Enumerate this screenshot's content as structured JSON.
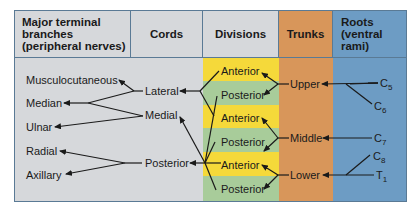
{
  "colors": {
    "gray": "#d6d8db",
    "yellow": "#f5d93a",
    "green": "#a8cc9a",
    "orange": "#d8965a",
    "blue": "#6d9cc4",
    "border": "#5a7a95",
    "line": "#1a1a1a"
  },
  "headers": {
    "branches": "Major terminal branches (peripheral nerves)",
    "branches_l1": "Major terminal",
    "branches_l2": "branches",
    "branches_l3": "(peripheral nerves)",
    "cords": "Cords",
    "divisions": "Divisions",
    "trunks": "Trunks",
    "roots_l1": "Roots",
    "roots_l2": "(ventral",
    "roots_l3": "rami)"
  },
  "branches": [
    "Musculocutaneous",
    "Median",
    "Ulnar",
    "Radial",
    "Axillary"
  ],
  "cords": [
    "Lateral",
    "Medial",
    "Posterior"
  ],
  "divisions": [
    "Anterior",
    "Posterior",
    "Anterior",
    "Posterior",
    "Anterior",
    "Posterior"
  ],
  "trunks": [
    "Upper",
    "Middle",
    "Lower"
  ],
  "roots": [
    {
      "base": "C",
      "sub": "5"
    },
    {
      "base": "C",
      "sub": "6"
    },
    {
      "base": "C",
      "sub": "7"
    },
    {
      "base": "C",
      "sub": "8"
    },
    {
      "base": "T",
      "sub": "1"
    }
  ]
}
